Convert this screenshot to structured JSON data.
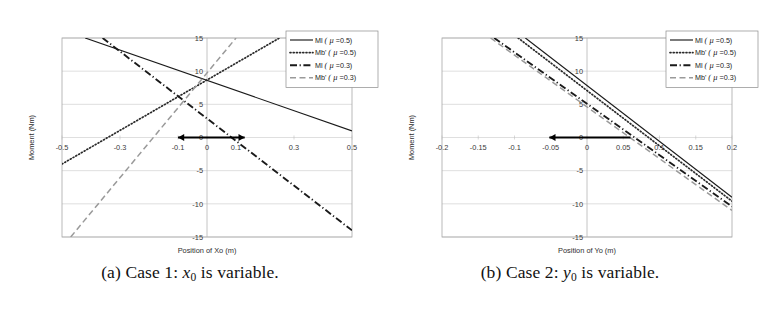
{
  "figure": {
    "panels": [
      {
        "id": "panel-a",
        "caption_prefix": "(a)",
        "caption_text": "Case 1:",
        "caption_var": "x",
        "caption_sub": "0",
        "caption_suffix": "is variable."
      },
      {
        "id": "panel-b",
        "caption_prefix": "(b)",
        "caption_text": "Case 2:",
        "caption_var": "y",
        "caption_sub": "0",
        "caption_suffix": "is variable."
      }
    ]
  },
  "legend": {
    "position": "top-right",
    "entries": [
      {
        "label": "Ml",
        "prime": "",
        "param": "( μ =0.5)",
        "style": "solid",
        "color": "#1a1a1a"
      },
      {
        "label": "Mb",
        "prime": "'",
        "param": "( μ =0.5)",
        "style": "dotted",
        "color": "#2a2a2a"
      },
      {
        "label": "Ml",
        "prime": "",
        "param": "( μ =0.3)",
        "style": "dashdot",
        "color": "#1a1a1a"
      },
      {
        "label": "Mb",
        "prime": "'",
        "param": "( μ =0.3)",
        "style": "dashed",
        "color": "#9a9a9a"
      }
    ]
  },
  "chart_data": [
    {
      "type": "line",
      "panel": "a",
      "title": "",
      "xlabel": "Position of Xo (m)",
      "ylabel": "Moment (Nm)",
      "xlim": [
        -0.5,
        0.5
      ],
      "ylim": [
        -15,
        15
      ],
      "xticks": [
        -0.5,
        -0.3,
        -0.1,
        0,
        0.1,
        0.3,
        0.5
      ],
      "xticklabels": [
        "-0.5",
        "-0.3",
        "-0.1",
        "0",
        "0.1",
        "0.3",
        "0.5"
      ],
      "yticks": [
        15,
        10,
        5,
        0,
        -5,
        -10,
        -15
      ],
      "yticklabels": [
        "15",
        "10",
        "5",
        "0",
        "-5",
        "-10",
        "-15"
      ],
      "grid": true,
      "series": [
        {
          "name": "Ml ( μ =0.5)",
          "style": "solid",
          "color": "#1a1a1a",
          "x": [
            -0.42,
            0.5
          ],
          "y": [
            15.0,
            1.0
          ]
        },
        {
          "name": "Mb' ( μ =0.5)",
          "style": "dotted",
          "color": "#2a2a2a",
          "x": [
            -0.5,
            0.25
          ],
          "y": [
            -4.0,
            15.0
          ]
        },
        {
          "name": "Ml ( μ =0.3)",
          "style": "dashdot",
          "color": "#1a1a1a",
          "x": [
            -0.36,
            0.5
          ],
          "y": [
            15.0,
            -14.0
          ]
        },
        {
          "name": "Mb' ( μ =0.3)",
          "style": "dashed",
          "color": "#9a9a9a",
          "x": [
            -0.47,
            0.1
          ],
          "y": [
            -15.0,
            15.0
          ]
        }
      ],
      "annotations": [
        {
          "kind": "double-arrow",
          "y": 0,
          "x_start": -0.1,
          "x_end": 0.13,
          "label": ""
        }
      ]
    },
    {
      "type": "line",
      "panel": "b",
      "title": "",
      "xlabel": "Position of Yo (m)",
      "ylabel": "Moment (Nm)",
      "xlim": [
        -0.2,
        0.2
      ],
      "ylim": [
        -15,
        15
      ],
      "xticks": [
        -0.2,
        -0.15,
        -0.1,
        -0.05,
        0,
        0.05,
        0.1,
        0.15,
        0.2
      ],
      "xticklabels": [
        "-0.2",
        "-0.15",
        "-0.1",
        "-0.05",
        "0",
        "0.05",
        "0.1",
        "0.15",
        "0.2"
      ],
      "yticks": [
        15,
        10,
        5,
        0,
        -5,
        -10,
        -15
      ],
      "yticklabels": [
        "15",
        "10",
        "5",
        "0",
        "-5",
        "-10",
        "-15"
      ],
      "grid": true,
      "series": [
        {
          "name": "Ml ( μ =0.5)",
          "style": "solid",
          "color": "#1a1a1a",
          "x": [
            -0.085,
            0.2
          ],
          "y": [
            15.0,
            -9.0
          ]
        },
        {
          "name": "Mb' ( μ =0.5)",
          "style": "dotted",
          "color": "#2a2a2a",
          "x": [
            -0.095,
            0.2
          ],
          "y": [
            15.0,
            -9.6
          ]
        },
        {
          "name": "Ml ( μ =0.3)",
          "style": "dashdot",
          "color": "#1a1a1a",
          "x": [
            -0.128,
            0.2
          ],
          "y": [
            15.0,
            -10.4
          ]
        },
        {
          "name": "Mb' ( μ =0.3)",
          "style": "dashed",
          "color": "#9a9a9a",
          "x": [
            -0.133,
            0.2
          ],
          "y": [
            15.0,
            -11.0
          ]
        }
      ],
      "annotations": [
        {
          "kind": "single-arrow-left",
          "y": 0,
          "x_start": 0.06,
          "x_end": -0.052,
          "label": ""
        }
      ]
    }
  ]
}
